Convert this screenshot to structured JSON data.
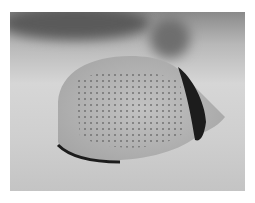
{
  "image": {
    "subject": "butterflyfish",
    "description": "Grayscale photo of a dotted butterflyfish swimming over sandy seabed",
    "colors": {
      "background": "#ffffff",
      "sand": "#d0d0d0",
      "body": "#b4b4b4",
      "band": "#1c1c1c",
      "dots": "#6a6a6a"
    }
  }
}
